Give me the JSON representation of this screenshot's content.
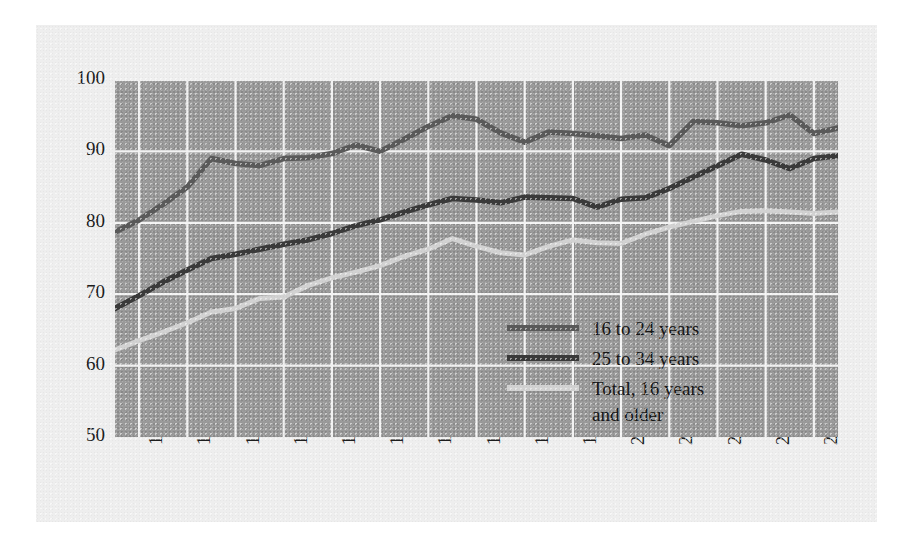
{
  "figure": {
    "panel_bg": "#eeeeee",
    "plot_bg": "#9a9a9a",
    "grid_color": "#f2f2f2"
  },
  "legend": {
    "position": "inside-bottom-right",
    "entries": [
      {
        "label": "16 to 24 years",
        "color": "#5a5a5a"
      },
      {
        "label": "25 to 34 years",
        "color": "#3a3a3a"
      },
      {
        "label": "Total, 16 years\nand older",
        "color": "#d2d2d2"
      }
    ]
  },
  "chart_data": {
    "type": "line",
    "title": "",
    "xlabel": "",
    "ylabel": "",
    "xlim": [
      1979,
      2009
    ],
    "ylim": [
      50,
      100
    ],
    "yticks": [
      50,
      60,
      70,
      80,
      90,
      100
    ],
    "ytick_labels": [
      "50",
      "60",
      "70",
      "80",
      "90",
      "100"
    ],
    "xticks": [
      1980,
      1982,
      1984,
      1986,
      1988,
      1990,
      1992,
      1994,
      1996,
      1998,
      2000,
      2002,
      2004,
      2006,
      2008
    ],
    "xtick_labels": [
      "1980",
      "1982",
      "1984",
      "1986",
      "1988",
      "1990",
      "1992",
      "1994",
      "1996",
      "1998",
      "2000",
      "2002",
      "2004",
      "2006",
      "2008"
    ],
    "grid": true,
    "x": [
      1979,
      1980,
      1981,
      1982,
      1983,
      1984,
      1985,
      1986,
      1987,
      1988,
      1989,
      1990,
      1991,
      1992,
      1993,
      1994,
      1995,
      1996,
      1997,
      1998,
      1999,
      2000,
      2001,
      2002,
      2003,
      2004,
      2005,
      2006,
      2007,
      2008,
      2009
    ],
    "series": [
      {
        "name": "16 to 24 years",
        "color": "#5a5a5a",
        "values": [
          78.7,
          80.4,
          82.6,
          85.0,
          89.0,
          88.3,
          88.0,
          89.0,
          89.1,
          89.7,
          90.9,
          90.0,
          91.7,
          93.5,
          95.0,
          94.5,
          92.6,
          91.3,
          92.7,
          92.5,
          92.2,
          91.8,
          92.3,
          90.8,
          94.2,
          94.0,
          93.6,
          94.0,
          95.1,
          92.5,
          93.3
        ]
      },
      {
        "name": "25 to 34 years",
        "color": "#3a3a3a",
        "values": [
          68.0,
          69.8,
          71.7,
          73.4,
          75.0,
          75.6,
          76.3,
          77.0,
          77.6,
          78.5,
          79.6,
          80.4,
          81.5,
          82.5,
          83.4,
          83.2,
          82.8,
          83.6,
          83.5,
          83.4,
          82.2,
          83.3,
          83.5,
          84.8,
          86.4,
          88.0,
          89.6,
          88.8,
          87.6,
          89.0,
          89.4
        ]
      },
      {
        "name": "Total, 16 years and older",
        "color": "#d2d2d2",
        "values": [
          62.2,
          63.5,
          64.7,
          66.0,
          67.5,
          68.0,
          69.4,
          69.6,
          71.2,
          72.3,
          73.1,
          74.0,
          75.3,
          76.3,
          77.8,
          76.7,
          75.8,
          75.5,
          76.7,
          77.6,
          77.2,
          77.1,
          78.4,
          79.4,
          80.2,
          81.0,
          81.6,
          81.7,
          81.5,
          81.3,
          81.5
        ]
      }
    ]
  }
}
